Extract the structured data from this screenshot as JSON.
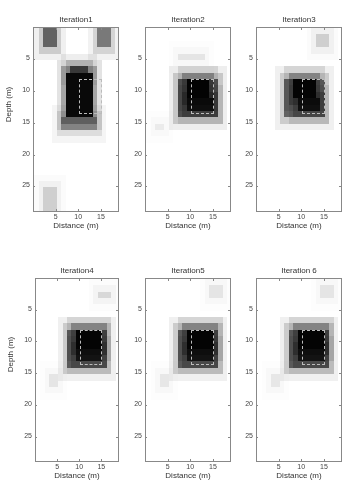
{
  "chart_data": {
    "type": "heatmap",
    "title": "",
    "colormap": "gray_reversed",
    "grid": false,
    "xlabel": "Distance (m)",
    "ylabel": "Depth (m)",
    "xlim": [
      0,
      19
    ],
    "ylim": [
      29,
      0
    ],
    "xticks": [
      5,
      10,
      15
    ],
    "yticks": [
      5,
      10,
      15,
      20,
      25
    ],
    "target_rectangle": {
      "x0": 10,
      "x1": 15,
      "y0": 8,
      "y1": 13.5
    },
    "panels": [
      {
        "title": "Iteration1",
        "blobs": [
          {
            "x0": 2,
            "x1": 5,
            "y0": 0,
            "y1": 3,
            "v": 0.55
          },
          {
            "x0": 14,
            "x1": 17,
            "y0": 0,
            "y1": 3,
            "v": 0.45
          },
          {
            "x0": 7,
            "x1": 13,
            "y0": 7,
            "y1": 14,
            "v": 1.0
          },
          {
            "x0": 8,
            "x1": 12,
            "y0": 6,
            "y1": 7,
            "v": 0.6
          },
          {
            "x0": 6,
            "x1": 14,
            "y0": 14,
            "y1": 16,
            "v": 0.35
          },
          {
            "x0": 2,
            "x1": 5,
            "y0": 25,
            "y1": 29,
            "v": 0.15
          }
        ]
      },
      {
        "title": "Iteration2",
        "blobs": [
          {
            "x0": 7,
            "x1": 13,
            "y0": 4,
            "y1": 5,
            "v": 0.08
          },
          {
            "x0": 7,
            "x1": 16,
            "y0": 8,
            "y1": 14,
            "v": 0.6
          },
          {
            "x0": 9,
            "x1": 14,
            "y0": 8,
            "y1": 11,
            "v": 1.0
          },
          {
            "x0": 9,
            "x1": 15,
            "y0": 11,
            "y1": 13,
            "v": 0.8
          },
          {
            "x0": 2,
            "x1": 4,
            "y0": 15,
            "y1": 16,
            "v": 0.06
          }
        ]
      },
      {
        "title": "Iteration3",
        "blobs": [
          {
            "x0": 13,
            "x1": 16,
            "y0": 1,
            "y1": 3,
            "v": 0.15
          },
          {
            "x0": 6,
            "x1": 15,
            "y0": 8,
            "y1": 14,
            "v": 0.55
          },
          {
            "x0": 8,
            "x1": 13,
            "y0": 8,
            "y1": 11,
            "v": 1.0
          },
          {
            "x0": 9,
            "x1": 14,
            "y0": 11,
            "y1": 13,
            "v": 0.8
          }
        ]
      },
      {
        "title": "Iteration4",
        "blobs": [
          {
            "x0": 14,
            "x1": 17,
            "y0": 2,
            "y1": 3,
            "v": 0.12
          },
          {
            "x0": 7,
            "x1": 16,
            "y0": 8,
            "y1": 14,
            "v": 0.55
          },
          {
            "x0": 9,
            "x1": 15,
            "y0": 8,
            "y1": 11,
            "v": 1.0
          },
          {
            "x0": 9,
            "x1": 15,
            "y0": 11,
            "y1": 13,
            "v": 0.75
          },
          {
            "x0": 3,
            "x1": 5,
            "y0": 15,
            "y1": 17,
            "v": 0.08
          }
        ]
      },
      {
        "title": "Iteration5",
        "blobs": [
          {
            "x0": 14,
            "x1": 17,
            "y0": 1,
            "y1": 3,
            "v": 0.08
          },
          {
            "x0": 7,
            "x1": 16,
            "y0": 8,
            "y1": 14,
            "v": 0.55
          },
          {
            "x0": 9,
            "x1": 15,
            "y0": 8,
            "y1": 11,
            "v": 1.0
          },
          {
            "x0": 9,
            "x1": 15,
            "y0": 11,
            "y1": 13,
            "v": 0.75
          },
          {
            "x0": 3,
            "x1": 5,
            "y0": 15,
            "y1": 17,
            "v": 0.07
          }
        ]
      },
      {
        "title": "Iteration 6",
        "blobs": [
          {
            "x0": 14,
            "x1": 17,
            "y0": 1,
            "y1": 3,
            "v": 0.08
          },
          {
            "x0": 7,
            "x1": 16,
            "y0": 8,
            "y1": 14,
            "v": 0.55
          },
          {
            "x0": 9,
            "x1": 15,
            "y0": 8,
            "y1": 11,
            "v": 1.0
          },
          {
            "x0": 9,
            "x1": 15,
            "y0": 11,
            "y1": 13,
            "v": 0.75
          },
          {
            "x0": 3,
            "x1": 5,
            "y0": 15,
            "y1": 17,
            "v": 0.07
          }
        ]
      }
    ]
  }
}
